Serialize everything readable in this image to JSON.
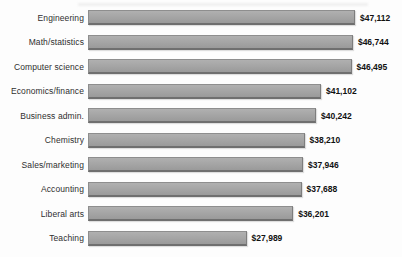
{
  "page": {
    "background": "#fdfdfd"
  },
  "chart_data": {
    "type": "bar",
    "orientation": "horizontal",
    "title": "",
    "xlabel": "",
    "ylabel": "",
    "grid": false,
    "legend": null,
    "xlim": [
      0,
      47112
    ],
    "categories": [
      "Engineering",
      "Math/statistics",
      "Computer science",
      "Economics/finance",
      "Business admin.",
      "Chemistry",
      "Sales/marketing",
      "Accounting",
      "Liberal arts",
      "Teaching"
    ],
    "values": [
      47112,
      46744,
      46495,
      41102,
      40242,
      38210,
      37946,
      37688,
      36201,
      27989
    ],
    "value_labels": [
      "$47,112",
      "$46,744",
      "$46,495",
      "$41,102",
      "$40,242",
      "$38,210",
      "$37,946",
      "$37,688",
      "$36,201",
      "$27,989"
    ],
    "bar_color": "#a4a4a4",
    "bar_border_color": "#6f6f6f",
    "category_label_color": "#2f2f2f",
    "value_label_color": "#111111"
  }
}
